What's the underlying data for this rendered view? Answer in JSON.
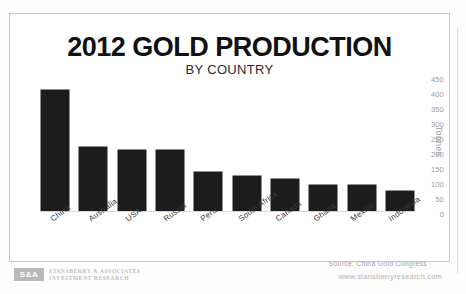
{
  "chart_data": {
    "type": "bar",
    "title": "2012 GOLD PRODUCTION",
    "subtitle": "BY COUNTRY",
    "xlabel": "",
    "ylabel": "Tonnes",
    "ylim": [
      0,
      450
    ],
    "yticks": [
      450,
      400,
      350,
      300,
      250,
      200,
      150,
      100,
      50,
      0
    ],
    "grid": false,
    "legend": "none",
    "source": "Source: China Gold Congress",
    "categories": [
      "China",
      "Australia",
      "USA",
      "Russia",
      "Peru",
      "South Africa",
      "Canada",
      "Ghana",
      "Mexico",
      "Indonesia"
    ],
    "values": [
      403,
      214,
      205,
      205,
      130,
      118,
      108,
      87,
      87,
      67
    ],
    "bar_color": "#1c1c1c"
  },
  "footer": {
    "logo_mark": "S&A",
    "logo_line1": "STANSBERRY & ASSOCIATES",
    "logo_line2": "INVESTMENT RESEARCH",
    "website": "www.stansberryresearch.com"
  }
}
